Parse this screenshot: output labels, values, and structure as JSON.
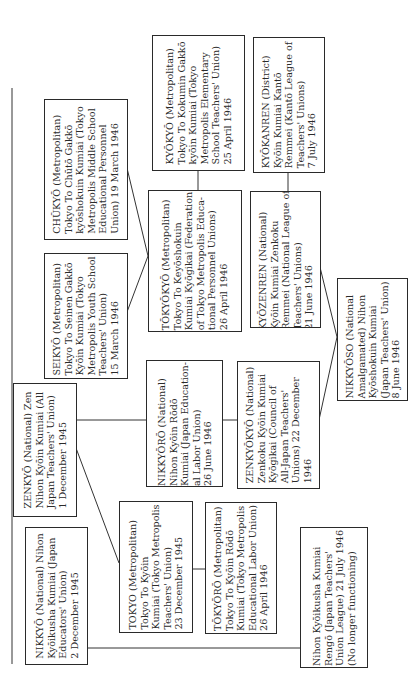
{
  "orientation": "rotated 90° counter-clockwise (text reads bottom-to-top)",
  "boxes": {
    "chukyo": {
      "lines": [
        "CHŪKYŌ (Metropolitan)",
        "Tokyo To Chūtō Gakkō",
        "kyōshokuin Kumiai (Tokyo",
        "Metropolis Middle School",
        "Educational Personnel",
        "Union) 19 March 1946"
      ]
    },
    "seikyo": {
      "lines": [
        "SEIKYŌ (Metropolitan)",
        "Tokyo To Seinen Gakkō",
        "Kyōin Kumiai (Tokyo",
        "Metropolis Youth School",
        "Teachers' Union)",
        "15 March 1946"
      ]
    },
    "kyokyo": {
      "lines": [
        "KYŌKYŌ (Metropolitan)",
        "Tokyo To Kokumin Gakkō",
        "kyōin Kumiai (Tokyo",
        "Metropolis Elementary",
        "School Teachers' Union)",
        "25 April 1946"
      ]
    },
    "tokyokyo": {
      "lines": [
        "TŌKYŌKYŌ (Metropolitan)",
        "Tokyo To Keyōshokuin",
        "Kumiai Kyōgikai (Federation",
        "of Tokyo Metropolis Educa-",
        "tional Personnel Unions)",
        "26 April 1946"
      ]
    },
    "kyokanren": {
      "lines": [
        "KYŌKANREN (District)",
        "Kyōin Kumiai Kantō",
        "Remmei (Kantō League of",
        "Teachers' Unions)",
        "7 July 1946"
      ]
    },
    "kyozenren": {
      "lines": [
        "KYŌZENREN (National)",
        "Kyōin Kumiai Zenkoku",
        "Remmei (National League of",
        "Teachers' Unions)",
        "21 June 1946"
      ]
    },
    "nikkyoso": {
      "lines": [
        "NIKKYŌSO (National",
        "Amalgamated) Nihon",
        "Kyōshokuin Kumiai",
        "(Japan Teachers' Union)",
        "8 June 1946"
      ]
    },
    "zenkyo": {
      "lines": [
        "ZENKYŌ (National) Zen",
        "Nihon Kyōin Kumiai (All",
        "Japan Teachers' Union)",
        "1 December 1945"
      ]
    },
    "nikkyoro": {
      "lines": [
        "NIKKYŌRŌ (National)",
        "Nihon Kyōin Rōdō",
        "Kumiai (Japan Education-",
        "al Labor Union)",
        "26 June 1946"
      ]
    },
    "zenkyokyo": {
      "lines": [
        "ZENKYŌKYŌ (National)",
        "Zenkoku Kyōin Kumiai",
        "Kyōgikai (Council of",
        "All-Japan Teachers'",
        "Unions) 22 December",
        "1946"
      ]
    },
    "nikkyo": {
      "lines": [
        "NIKKYŌ (National) Nihon",
        "Kyōikusha Kumiai (Japan",
        "Educators' Union)",
        "2 December 1945"
      ]
    },
    "tokyo": {
      "lines": [
        "TOKYO (Metropolitan)",
        "Tokyo To Kyōin",
        "Kumiai (Tokyo Metropolis",
        "Teachers' Union)",
        "23 December 1945"
      ]
    },
    "tokyoro": {
      "lines": [
        "TŌKYŌRŌ (Metropolitan)",
        "Tokyo To Kyōin Rōdō",
        "Kumiai (Tokyo Metropolis",
        "Educational Labor Union)",
        "26 April 1946"
      ]
    },
    "rengo": {
      "lines": [
        "Nihon Kyōikusha Kumiai",
        "Rengō (Japan Teachers'",
        "Union League) 21 July 1946",
        "(No longer functioning)"
      ]
    }
  },
  "connections": [
    [
      "chukyo",
      "tokyokyo"
    ],
    [
      "seikyo",
      "tokyokyo"
    ],
    [
      "kyokyo",
      "tokyokyo"
    ],
    [
      "kyokanren",
      "kyozenren"
    ],
    [
      "kyozenren",
      "nikkyoso"
    ],
    [
      "zenkyokyo",
      "nikkyoso"
    ],
    [
      "zenkyo",
      "nikkyoro"
    ],
    [
      "nikkyoro",
      "zenkyokyo"
    ],
    [
      "zenkyo",
      "tokyo"
    ],
    [
      "tokyo",
      "tokyoro"
    ],
    [
      "nikkyo",
      "rengo"
    ]
  ]
}
